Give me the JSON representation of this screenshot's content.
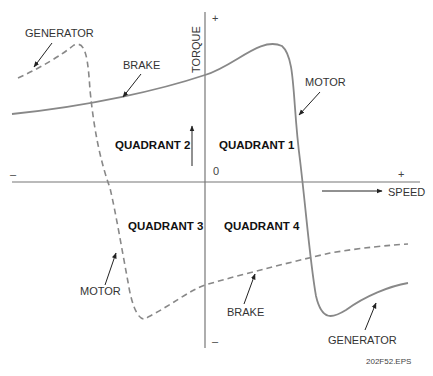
{
  "axes": {
    "x_label": "SPEED",
    "y_label": "TORQUE",
    "origin": "0",
    "x_plus": "+",
    "x_minus": "–",
    "y_plus": "+",
    "y_minus": "–"
  },
  "quadrants": {
    "q1": "QUADRANT 1",
    "q2": "QUADRANT 2",
    "q3": "QUADRANT 3",
    "q4": "QUADRANT 4"
  },
  "annotations": {
    "generator_top": "GENERATOR",
    "brake_top": "BRAKE",
    "motor_right": "MOTOR",
    "motor_left": "MOTOR",
    "brake_bottom": "BRAKE",
    "generator_bottom": "GENERATOR"
  },
  "figure_id": "202F52.EPS",
  "curves": [
    {
      "name": "forward-torque-speed",
      "style": "solid",
      "regions": [
        "BRAKE",
        "MOTOR",
        "GENERATOR"
      ]
    },
    {
      "name": "reverse-torque-speed",
      "style": "dashed",
      "regions": [
        "GENERATOR",
        "MOTOR",
        "BRAKE"
      ]
    }
  ]
}
